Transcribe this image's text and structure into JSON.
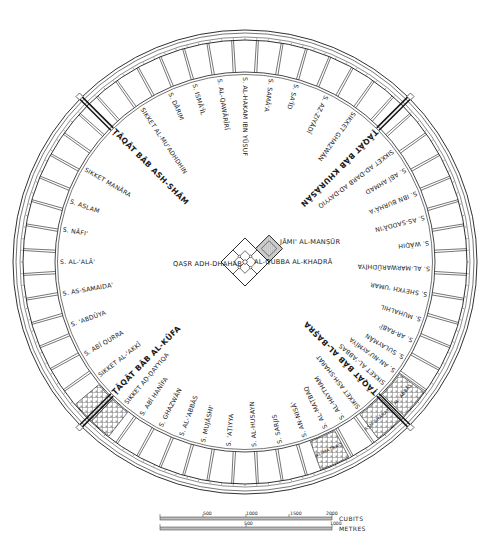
{
  "colors": {
    "ink": "#1a1a1a",
    "background": "#ffffff",
    "hatch": "#8a8a8a",
    "mosque_fill": "#c8c8c8"
  },
  "geometry": {
    "center": [
      245,
      262
    ],
    "outer_wall_radius": 232,
    "inner_wall_radius": 222,
    "ring_inner_radius": 190,
    "blocks_per_circle": 56
  },
  "center_complex": {
    "palace": "QAṢR ADH-DHAHAB",
    "mosque": "JĀMI' AL-MANṢŪR",
    "dome": "AL-QUBBA AL-KHAḌRĀ"
  },
  "gates": [
    {
      "name": "ṬĀQĀT BĀB ASH-SHĀM",
      "angle": -135
    },
    {
      "name": "ṬĀQĀT BĀB KHURĀSĀN",
      "angle": -45
    },
    {
      "name": "ṬĀQĀT BĀB AL-BAṢRA",
      "angle": 45
    },
    {
      "name": "ṬĀQĀT BĀB AL-KŪFA",
      "angle": 135
    }
  ],
  "streets": [
    {
      "name": "S. ISMĀ'ĪL",
      "angle": -106
    },
    {
      "name": "S. AL-QAWĀRĪRĪ",
      "angle": -98
    },
    {
      "name": "S. AL-HAKAM IBN YŪSUF",
      "angle": -90
    },
    {
      "name": "S. SAMĀ'A",
      "angle": -82
    },
    {
      "name": "S. SA'ĪD",
      "angle": -74
    },
    {
      "name": "S. AZ-ZIYĀDĪ",
      "angle": -64
    },
    {
      "name": "SIKKET GHAZWĀN",
      "angle": -54
    },
    {
      "name": "SIKKET AD-DARB AD-DAYYIQ",
      "angle": -37
    },
    {
      "name": "S. ABĪ AHMAD",
      "angle": -30
    },
    {
      "name": "S. IBN BURHĀ'A",
      "angle": -22
    },
    {
      "name": "S. AS-SADDĀ'IN",
      "angle": -14
    },
    {
      "name": "S. WĀḌIH",
      "angle": -6
    },
    {
      "name": "S. AL-MARWARŪDHĪYA",
      "angle": 2
    },
    {
      "name": "S. SHEYKH 'UMAR",
      "angle": 10
    },
    {
      "name": "S. MUHALHIL",
      "angle": 18
    },
    {
      "name": "S. AR-RABĪ'",
      "angle": 25
    },
    {
      "name": "S. SULAYMĀN",
      "angle": 31
    },
    {
      "name": "S. AN-NU'AYMĪYA",
      "angle": 36
    },
    {
      "name": "SIKKET AL-'ABBAS",
      "angle": 41
    },
    {
      "name": "SIKKET ASH-SHARAT",
      "angle": 52
    },
    {
      "name": "S. AL-HAYTHAM",
      "angle": 58
    },
    {
      "name": "S. AL-MAṬBAQ",
      "angle": 64
    },
    {
      "name": "S. AN-NISĀ'",
      "angle": 71
    },
    {
      "name": "S. SARJIS",
      "angle": 79
    },
    {
      "name": "S. AL-HUSAYN",
      "angle": 87
    },
    {
      "name": "S. 'AṬIYYA",
      "angle": 95
    },
    {
      "name": "S. MUJĀSHI'",
      "angle": 103
    },
    {
      "name": "S. AL-'ABBĀS",
      "angle": 110
    },
    {
      "name": "S. GHAZWĀN",
      "angle": 117
    },
    {
      "name": "S. ABĪ HANĪFA",
      "angle": 124
    },
    {
      "name": "SIKKET AḌ-ḌAYYIQA",
      "angle": 130
    },
    {
      "name": "SIKKET AL-'AKKĪ",
      "angle": 142
    },
    {
      "name": "S. ABĪ QURRA",
      "angle": 150
    },
    {
      "name": "S. 'ABDŪYA",
      "angle": 160
    },
    {
      "name": "S. AS-SAMAIDA'",
      "angle": 170
    },
    {
      "name": "S. AL-'ALĀ'",
      "angle": 180
    },
    {
      "name": "S. NĀFI'",
      "angle": -170
    },
    {
      "name": "S. ASLAM",
      "angle": -161
    },
    {
      "name": "SIKKET MANĀRA",
      "angle": -150
    },
    {
      "name": "SIKKET AL-MU'ADHDHIN",
      "angle": -124
    },
    {
      "name": "S. DĀRIM",
      "angle": -114
    }
  ],
  "prisons_markets": [
    {
      "name": "AL-MAṬBAQ",
      "angle": 66
    },
    {
      "name": "ASH-SHĀRAṬ",
      "angle": 50
    },
    {
      "name": "AL-'ABBĀS",
      "angle": 40
    }
  ],
  "scale": {
    "cubits": {
      "label": "CUBITS",
      "ticks": [
        "500",
        "1000",
        "1500",
        "2000"
      ]
    },
    "metres": {
      "label": "METRES",
      "ticks": [
        "500",
        "1000"
      ]
    }
  }
}
